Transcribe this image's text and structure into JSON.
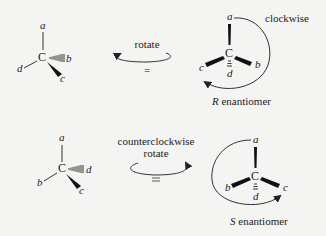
{
  "top_row": {
    "left_molecule": {
      "center": "C",
      "substituents": {
        "top": "a",
        "left": "d",
        "right_hashed": "b",
        "bottom_wedge": "c"
      }
    },
    "arrow": {
      "label": "rotate",
      "symbol": "="
    },
    "right_molecule": {
      "center": "C",
      "substituents": {
        "top": "a",
        "left": "c",
        "right": "b",
        "bottom_back": "d"
      },
      "rotation_label": "clockwise",
      "configuration_letter": "R",
      "configuration_suffix": " enantiomer"
    }
  },
  "bottom_row": {
    "left_molecule": {
      "center": "C",
      "substituents": {
        "top": "a",
        "left": "b",
        "right_hashed": "d",
        "bottom_wedge": "c"
      }
    },
    "arrow": {
      "label_line1": "counterclockwise",
      "label_line2": "rotate",
      "symbol": "="
    },
    "right_molecule": {
      "center": "C",
      "substituents": {
        "top": "a",
        "left": "b",
        "right": "c",
        "bottom_back": "d"
      },
      "configuration_letter": "S",
      "configuration_suffix": " enantiomer"
    }
  }
}
